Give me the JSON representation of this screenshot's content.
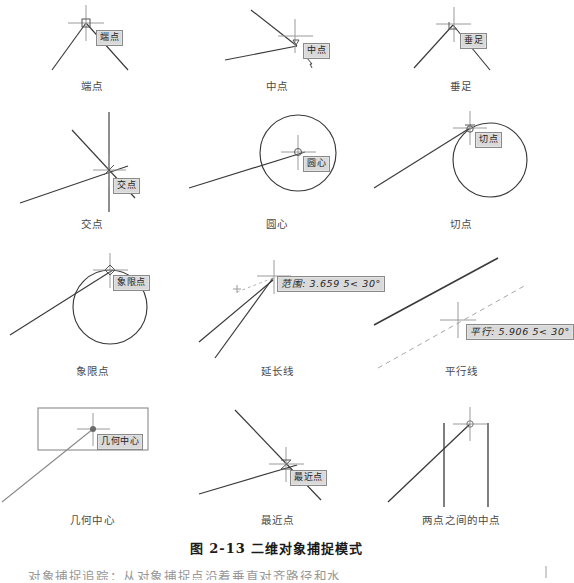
{
  "figure": {
    "caption_number": "图 2-13",
    "caption_title": "二维对象捕捉模式",
    "caption_full": "图 2-13    二维对象捕捉模式"
  },
  "panels": [
    {
      "id": "endpoint",
      "label": "端点",
      "tooltip": "端点",
      "row": 1,
      "col": 1
    },
    {
      "id": "midpoint",
      "label": "中点",
      "tooltip": "中点",
      "row": 1,
      "col": 2
    },
    {
      "id": "perpendicular",
      "label": "垂足",
      "tooltip": "垂足",
      "row": 1,
      "col": 3
    },
    {
      "id": "intersection",
      "label": "交点",
      "tooltip": "交点",
      "row": 2,
      "col": 1
    },
    {
      "id": "center",
      "label": "圆心",
      "tooltip": "圆心",
      "row": 2,
      "col": 2
    },
    {
      "id": "tangent",
      "label": "切点",
      "tooltip": "切点",
      "row": 2,
      "col": 3
    },
    {
      "id": "quadrant",
      "label": "象限点",
      "tooltip": "象限点",
      "row": 3,
      "col": 1
    },
    {
      "id": "extension",
      "label": "延长线",
      "tooltip": "范围: 3.659 5< 30°",
      "row": 3,
      "col": 2
    },
    {
      "id": "parallel",
      "label": "平行线",
      "tooltip": "平行: 5.906 5< 30°",
      "row": 3,
      "col": 3
    },
    {
      "id": "geometric-center",
      "label": "几何中心",
      "tooltip": "几何中心",
      "row": 4,
      "col": 1
    },
    {
      "id": "nearest",
      "label": "最近点",
      "tooltip": "最近点",
      "row": 4,
      "col": 2
    },
    {
      "id": "mid-between-two",
      "label": "两点之间的中点",
      "tooltip": "",
      "row": 4,
      "col": 3
    }
  ],
  "body_text": "对象捕捉追踪：从对象捕捉点沿着垂直对齐路径和水",
  "colors": {
    "line": "#3a3a3a",
    "tooltip_bg": "#d9d9d9",
    "tooltip_border": "#8a8a8a",
    "crosshair": "#9a9a9a",
    "caption": "#1a1a1a",
    "page": "#ffffff"
  }
}
